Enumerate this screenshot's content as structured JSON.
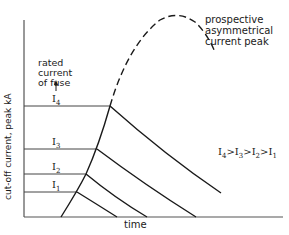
{
  "diagram": {
    "y_axis_label": "cut-off current, peak kA",
    "x_axis_label": "time",
    "rated_current_label": [
      "rated",
      "current",
      "of fuse"
    ],
    "peak_label": [
      "prospective",
      "asymmetrical",
      "current peak"
    ],
    "relation": {
      "base": [
        "I",
        "I",
        "I",
        "I"
      ],
      "subs": [
        "4",
        "3",
        "2",
        "1"
      ],
      "sep": ">"
    },
    "levels": [
      {
        "name": "I",
        "sub": "4",
        "y": 106,
        "x_end": 110,
        "decay_end": [
          221,
          193
        ]
      },
      {
        "name": "I",
        "sub": "3",
        "y": 149,
        "x_end": 97,
        "decay_end": [
          196,
          217
        ]
      },
      {
        "name": "I",
        "sub": "2",
        "y": 174,
        "x_end": 86,
        "decay_end": [
          147,
          217
        ]
      },
      {
        "name": "I",
        "sub": "1",
        "y": 192,
        "x_end": 77,
        "decay_end": [
          117,
          217
        ]
      }
    ],
    "colors": {
      "line": "#1a1a1a",
      "axis": "#555555"
    }
  }
}
